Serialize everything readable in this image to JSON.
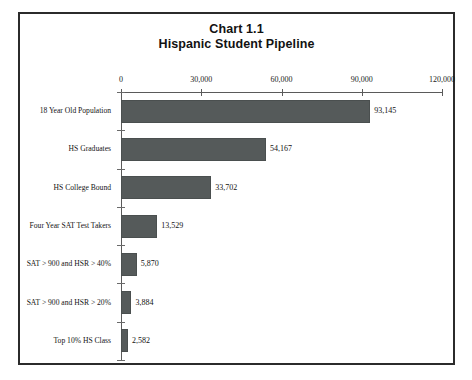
{
  "chart_data": {
    "type": "bar",
    "orientation": "horizontal",
    "title": "Chart 1.1",
    "subtitle": "Hispanic Student Pipeline",
    "xlabel": "",
    "ylabel": "",
    "xlim": [
      0,
      120000
    ],
    "grid": false,
    "legend": null,
    "bar_color": "#555a5a",
    "xticks": [
      0,
      30000,
      60000,
      90000,
      120000
    ],
    "xtick_labels": [
      "0",
      "30,000",
      "60,000",
      "90,000",
      "120,000"
    ],
    "categories": [
      "18 Year Old Population",
      "HS Graduates",
      "HS College Bound",
      "Four Year SAT Test Takers",
      "SAT > 900 and HSR > 40%",
      "SAT > 900 and HSR > 20%",
      "Top 10% HS Class"
    ],
    "values": [
      93145,
      54167,
      33702,
      13529,
      5870,
      3884,
      2582
    ],
    "value_labels": [
      "93,145",
      "54,167",
      "33,702",
      "13,529",
      "5,870",
      "3,884",
      "2,582"
    ]
  }
}
